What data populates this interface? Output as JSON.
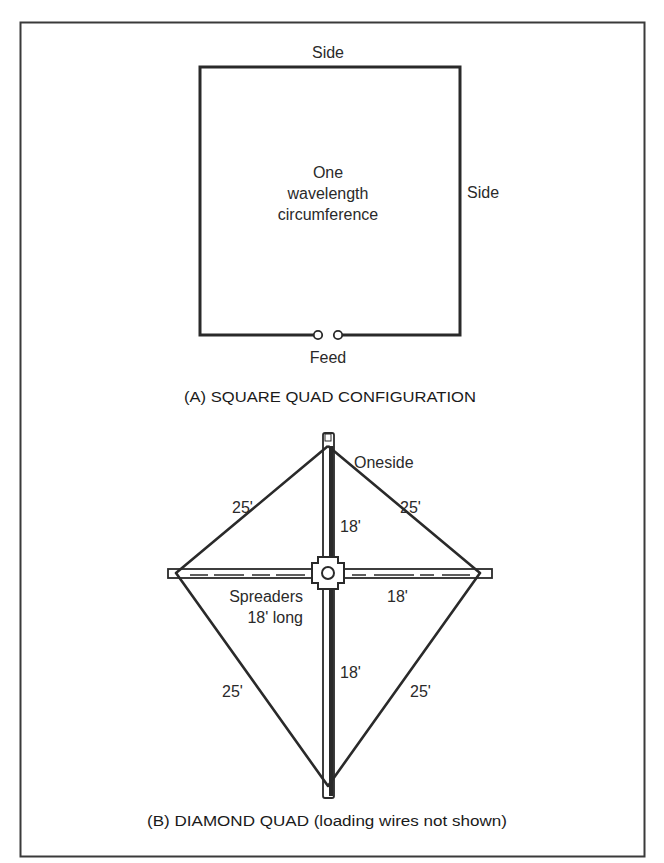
{
  "diagram": {
    "colors": {
      "line": "#2a2a2a",
      "frame": "#3a3a3a",
      "background": "#ffffff"
    },
    "square_quad": {
      "labels": {
        "top_side": "Side",
        "right_side": "Side",
        "center_line1": "One",
        "center_line2": "wavelength",
        "center_line3": "circumference",
        "feed": "Feed"
      },
      "caption": "(A) SQUARE QUAD CONFIGURATION"
    },
    "diamond_quad": {
      "labels": {
        "oneside": "Oneside",
        "upper_left_side": "25'",
        "upper_right_side": "25'",
        "lower_left_side": "25'",
        "lower_right_side": "25'",
        "upper_mast": "18'",
        "lower_mast": "18'",
        "right_spreader": "18'",
        "spreaders_line1": "Spreaders",
        "spreaders_line2": "18' long"
      },
      "caption": "(B) DIAMOND QUAD (loading wires not shown)"
    }
  }
}
